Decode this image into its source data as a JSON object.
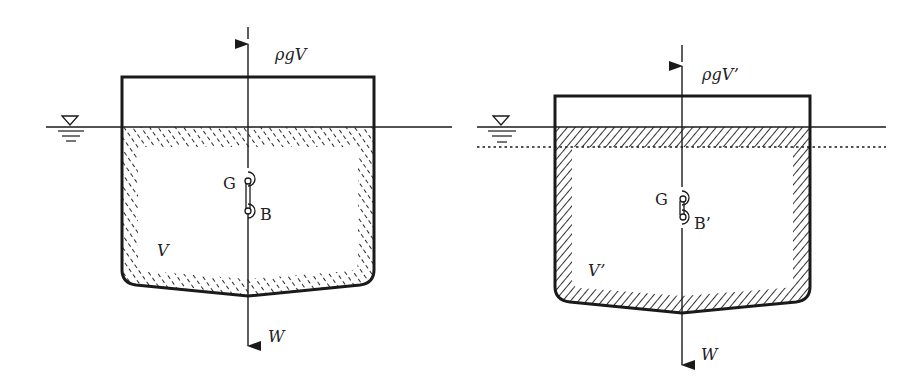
{
  "figure": {
    "panels": [
      {
        "id": "left",
        "buoyancy_label": "ρgV",
        "weight_label": "W",
        "volume_label": "V",
        "g_label": "G",
        "b_label": "B"
      },
      {
        "id": "right",
        "buoyancy_label": "ρgV’",
        "weight_label": "W",
        "volume_label": "V’",
        "g_label": "G",
        "b_label": "B’"
      }
    ],
    "colors": {
      "stroke": "#1a1a1a",
      "hatch": "#2a2a2a",
      "background": "#ffffff"
    }
  }
}
